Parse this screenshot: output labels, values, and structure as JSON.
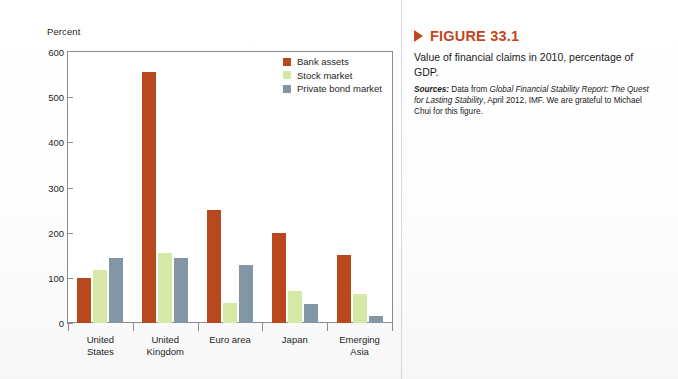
{
  "chart_data": {
    "type": "bar",
    "title": "",
    "xlabel": "",
    "ylabel": "Percent",
    "ylim": [
      0,
      600
    ],
    "yticks": [
      0,
      100,
      200,
      300,
      400,
      500,
      600
    ],
    "grid": false,
    "legend_position": "top-right inside plot",
    "categories": [
      "United States",
      "United Kingdom",
      "Euro area",
      "Japan",
      "Emerging Asia"
    ],
    "series": [
      {
        "name": "Bank assets",
        "color": "#b8491e",
        "values": [
          100,
          555,
          250,
          200,
          150
        ]
      },
      {
        "name": "Stock market",
        "color": "#d5e8a6",
        "values": [
          118,
          155,
          45,
          70,
          65
        ]
      },
      {
        "name": "Private bond market",
        "color": "#8396a6",
        "values": [
          145,
          145,
          128,
          42,
          15
        ]
      }
    ]
  },
  "chart": {
    "y_axis_title": "Percent",
    "y_tick_labels": [
      "600",
      "500",
      "400",
      "300",
      "200",
      "100",
      "0"
    ],
    "category_lines": [
      [
        "United",
        "States"
      ],
      [
        "United",
        "Kingdom"
      ],
      [
        "Euro area",
        ""
      ],
      [
        "Japan",
        ""
      ],
      [
        "Emerging",
        "Asia"
      ]
    ]
  },
  "caption": {
    "figure_label": "FIGURE 33.1",
    "text": "Value of financial claims in 2010, percentage of GDP.",
    "sources_label": "Sources:",
    "sources_part1": " Data from ",
    "sources_title": "Global Financial Stability Report: The Quest for Lasting Stability",
    "sources_part2": ", April 2012, IMF. We are grateful to Michael Chui for this figure."
  },
  "colors": {
    "accent": "#c0481f",
    "bank_assets": "#b8491e",
    "stock_market": "#d5e8a6",
    "private_bond_market": "#8396a6",
    "axis": "#8c8c8c"
  }
}
